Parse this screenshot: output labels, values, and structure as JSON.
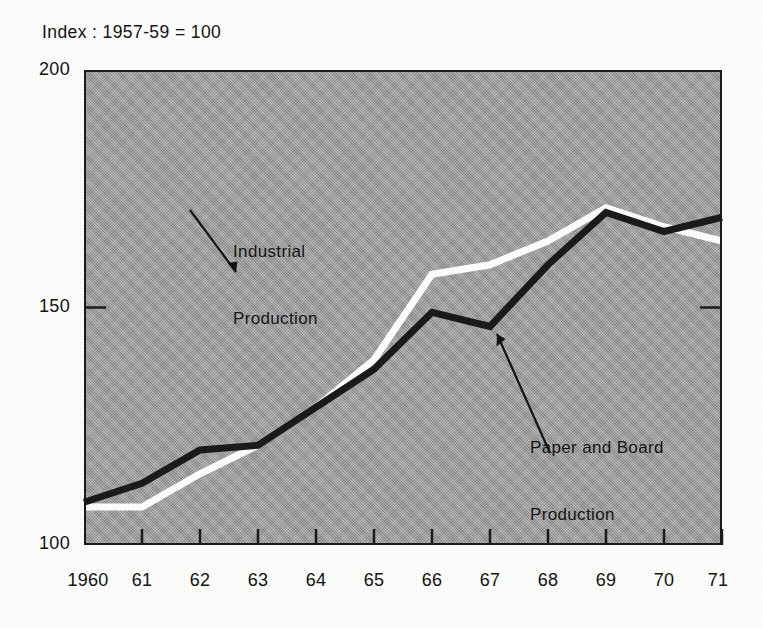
{
  "chart_data": {
    "type": "line",
    "title": "Index : 1957-59 = 100",
    "xlabel": "",
    "ylabel": "",
    "xlim": [
      1960,
      1971
    ],
    "ylim": [
      100,
      200
    ],
    "yticks": [
      100,
      150,
      200
    ],
    "ytick_labels": [
      "100",
      "150",
      "200"
    ],
    "x": [
      1960,
      1961,
      1962,
      1963,
      1964,
      1965,
      1966,
      1967,
      1968,
      1969,
      1970,
      1971
    ],
    "xtick_labels": [
      "1960",
      "61",
      "62",
      "63",
      "64",
      "65",
      "66",
      "67",
      "68",
      "69",
      "70",
      "71"
    ],
    "grid": false,
    "legend": "annotations",
    "plot_background": "#a3a3a3",
    "series": [
      {
        "name": "Industrial Production",
        "color": "#ffffff",
        "values": [
          108,
          108,
          115,
          121,
          129,
          139,
          157,
          159,
          164,
          171,
          167,
          164
        ]
      },
      {
        "name": "Paper and Board Production",
        "color": "#1b1b1b",
        "values": [
          109,
          113,
          120,
          121,
          129,
          137,
          149,
          146,
          159,
          170,
          166,
          169
        ]
      }
    ],
    "annotations": [
      {
        "label_line1": "Industrial",
        "label_line2": "Production",
        "target_series": "Industrial Production",
        "arrow": "down-right"
      },
      {
        "label_line1": "Paper and Board",
        "label_line2": "Production",
        "target_series": "Paper and Board Production",
        "arrow": "up-left"
      }
    ]
  }
}
